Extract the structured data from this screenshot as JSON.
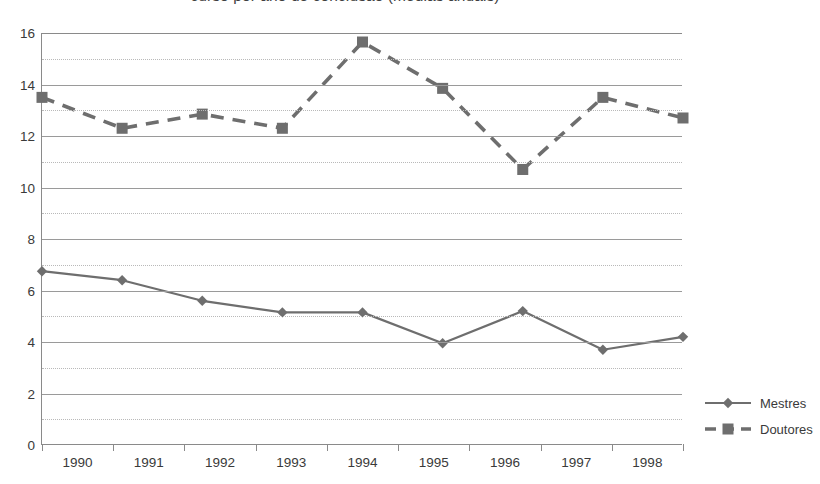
{
  "chart_data": {
    "type": "line",
    "title": "curso por ano de conclusão (médias anuais)",
    "xlabel": "",
    "ylabel": "",
    "categories": [
      "1990",
      "1991",
      "1992",
      "1993",
      "1994",
      "1995",
      "1996",
      "1997",
      "1998"
    ],
    "ylim": [
      0,
      16
    ],
    "ytick_values": [
      0,
      2,
      4,
      6,
      8,
      10,
      12,
      14,
      16
    ],
    "ytick_labels": [
      "0",
      "2",
      "4",
      "6",
      "8",
      "10",
      "12",
      "14",
      "16"
    ],
    "minor_gridline_values": [
      1,
      3,
      5,
      7,
      9,
      11,
      13,
      15
    ],
    "grid": true,
    "legend_position": "right",
    "series": [
      {
        "name": "Mestres",
        "color": "#6e6e6e",
        "dash": "solid",
        "marker": "diamond",
        "values": [
          6.75,
          6.4,
          5.6,
          5.15,
          5.15,
          3.95,
          5.2,
          3.7,
          4.2
        ]
      },
      {
        "name": "Doutores",
        "color": "#6e6e6e",
        "dash": "dashed",
        "marker": "square",
        "values": [
          13.5,
          12.3,
          12.85,
          12.3,
          15.65,
          13.85,
          10.7,
          13.5,
          12.7
        ]
      }
    ]
  }
}
